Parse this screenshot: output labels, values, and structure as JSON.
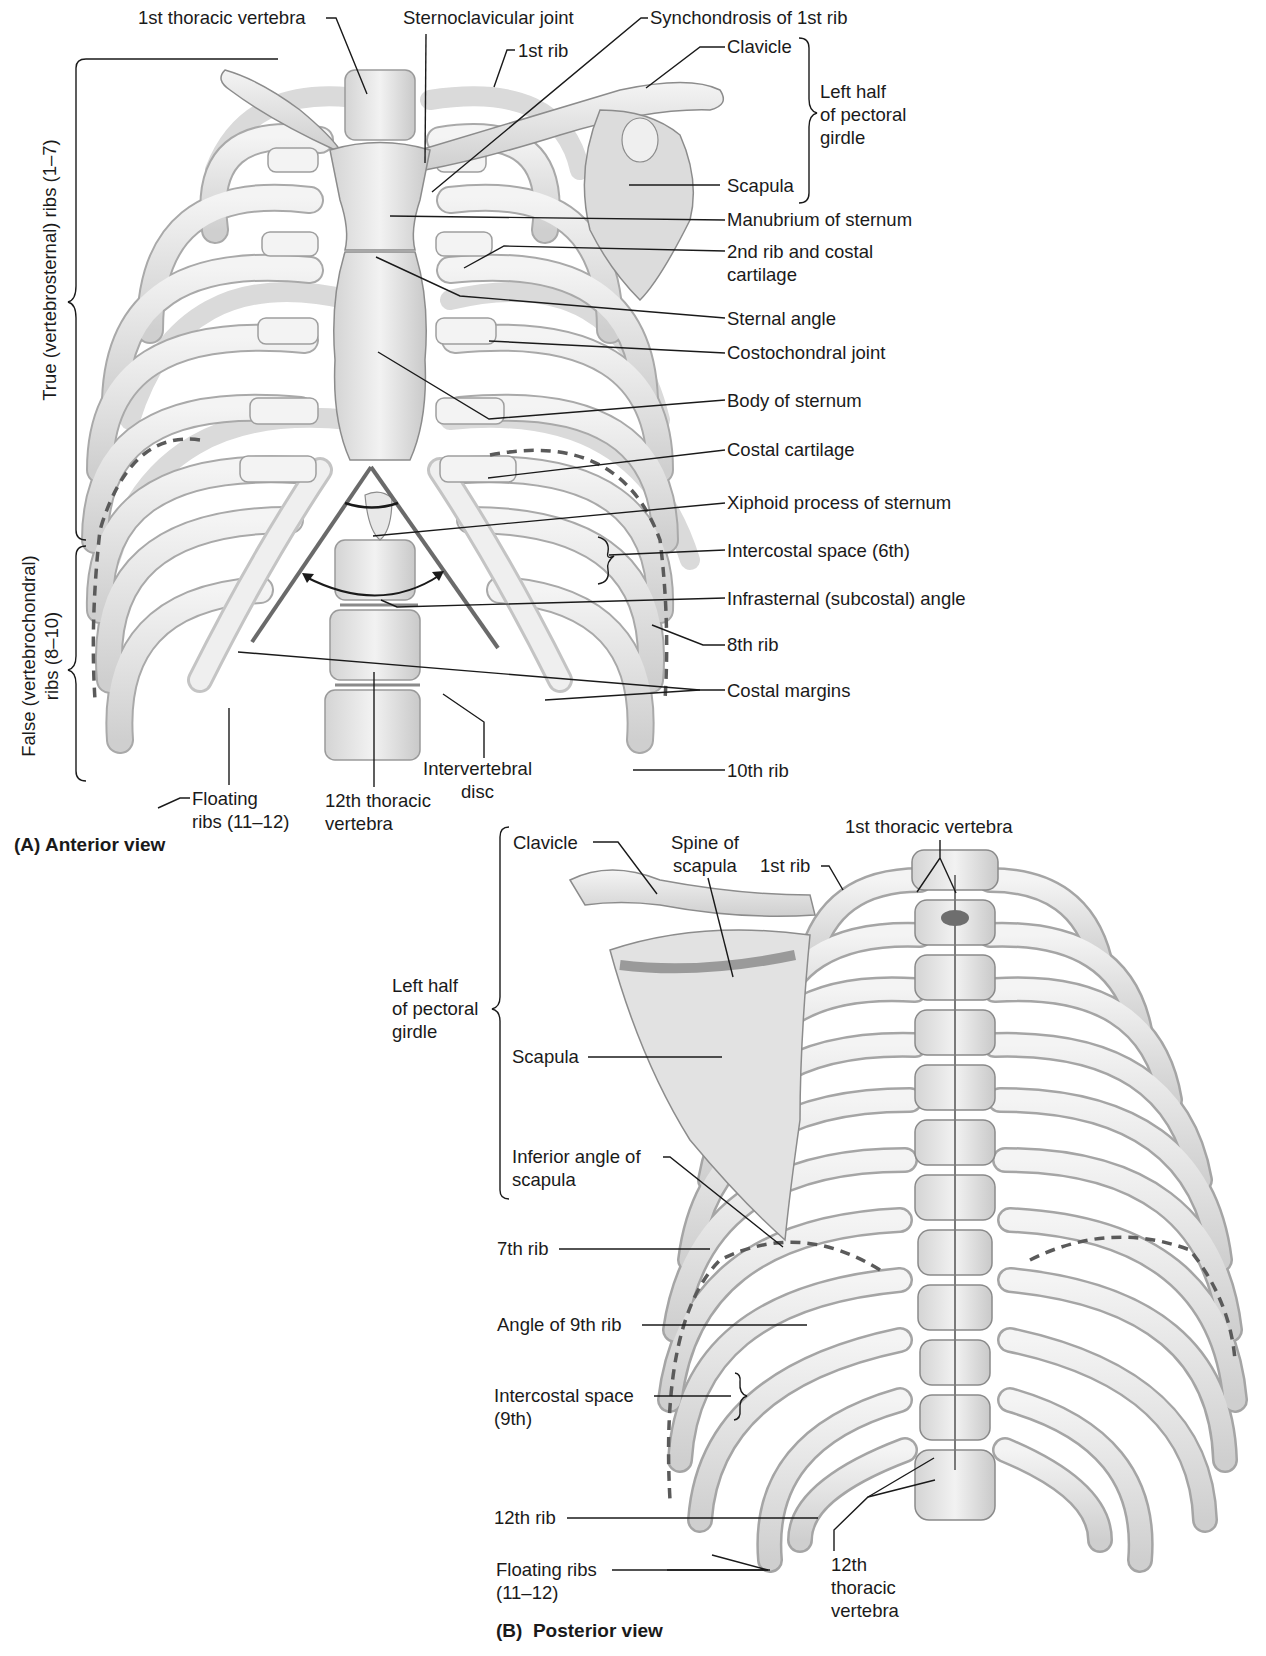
{
  "figure": {
    "colors": {
      "bone_fill": "#ebebeb",
      "bone_shadow": "#bdbdbd",
      "bone_outline": "#8c8c8c",
      "cartilage_fill": "#f3f3f3",
      "leader_line": "#1a1a1a",
      "angle_marker": "#6a6a6a",
      "dashed_line": "#5a5a5a",
      "background": "#ffffff"
    }
  },
  "anterior": {
    "caption": "(A) Anterior view",
    "brackets": {
      "true_ribs": "True (vertebrosternal) ribs (1–7)",
      "false_ribs": "False (vertebrochondral)\nribs (8–10)",
      "pectoral_girdle": "Left half\nof pectoral\ngirdle"
    },
    "labels": [
      {
        "id": "first-thoracic-vertebra",
        "text": "1st thoracic vertebra"
      },
      {
        "id": "sternoclavicular-joint",
        "text": "Sternoclavicular joint"
      },
      {
        "id": "synchondrosis-1st-rib",
        "text": "Synchondrosis of 1st rib"
      },
      {
        "id": "first-rib",
        "text": "1st rib"
      },
      {
        "id": "clavicle",
        "text": "Clavicle"
      },
      {
        "id": "scapula",
        "text": "Scapula"
      },
      {
        "id": "manubrium",
        "text": "Manubrium of sternum"
      },
      {
        "id": "second-rib-costal-cartilage",
        "text": "2nd rib and costal\ncartilage"
      },
      {
        "id": "sternal-angle",
        "text": "Sternal angle"
      },
      {
        "id": "costochondral-joint",
        "text": "Costochondral joint"
      },
      {
        "id": "body-of-sternum",
        "text": "Body of sternum"
      },
      {
        "id": "costal-cartilage",
        "text": "Costal cartilage"
      },
      {
        "id": "xiphoid-process",
        "text": "Xiphoid process of sternum"
      },
      {
        "id": "intercostal-space-6th",
        "text": "Intercostal space (6th)"
      },
      {
        "id": "infrasternal-angle",
        "text": "Infrasternal (subcostal) angle"
      },
      {
        "id": "eighth-rib",
        "text": "8th rib"
      },
      {
        "id": "costal-margins",
        "text": "Costal margins"
      },
      {
        "id": "tenth-rib",
        "text": "10th rib"
      },
      {
        "id": "intervertebral-disc",
        "text": "Intervertebral\ndisc"
      },
      {
        "id": "twelfth-thoracic-vertebra",
        "text": "12th thoracic\nvertebra"
      },
      {
        "id": "floating-ribs",
        "text": "Floating\nribs (11–12)"
      }
    ]
  },
  "posterior": {
    "caption": "(B)  Posterior view",
    "brackets": {
      "pectoral_girdle": "Left half\nof pectoral\ngirdle"
    },
    "labels": [
      {
        "id": "clavicle",
        "text": "Clavicle"
      },
      {
        "id": "spine-of-scapula",
        "text": "Spine of\nscapula"
      },
      {
        "id": "first-rib",
        "text": "1st rib"
      },
      {
        "id": "first-thoracic-vertebra",
        "text": "1st thoracic vertebra"
      },
      {
        "id": "scapula",
        "text": "Scapula"
      },
      {
        "id": "inferior-angle-scapula",
        "text": "Inferior angle of\nscapula"
      },
      {
        "id": "seventh-rib",
        "text": "7th rib"
      },
      {
        "id": "angle-of-9th-rib",
        "text": "Angle of 9th rib"
      },
      {
        "id": "intercostal-space-9th",
        "text": "Intercostal space\n(9th)"
      },
      {
        "id": "twelfth-rib",
        "text": "12th rib"
      },
      {
        "id": "floating-ribs",
        "text": "Floating ribs\n(11–12)"
      },
      {
        "id": "twelfth-thoracic-vertebra",
        "text": "12th\nthoracic\nvertebra"
      }
    ]
  }
}
